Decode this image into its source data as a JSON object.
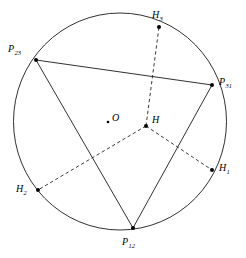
{
  "figure": {
    "background_color": "#ffffff",
    "stroke_color": "#1a1a1a",
    "point_color": "#000000",
    "width": 246,
    "height": 258
  },
  "chart_data": {
    "type": "diagram",
    "title": "",
    "xlabel": "",
    "ylabel": "",
    "circle": {
      "name": "circumcircle",
      "cx": 120,
      "cy": 121.5,
      "r": 106.5,
      "style": "solid"
    },
    "points": [
      {
        "id": "P23",
        "label": "P",
        "sub": "23",
        "x": 36,
        "y": 60,
        "label_x": 8,
        "label_y": 44,
        "on_circle": true,
        "marker": "dot"
      },
      {
        "id": "P31",
        "label": "P",
        "sub": "31",
        "x": 212,
        "y": 85,
        "label_x": 219,
        "label_y": 77,
        "on_circle": true,
        "marker": "dot"
      },
      {
        "id": "P12",
        "label": "P",
        "sub": "12",
        "x": 133,
        "y": 228,
        "label_x": 122,
        "label_y": 237,
        "on_circle": true,
        "marker": "dot"
      },
      {
        "id": "H3",
        "label": "H",
        "sub": "3",
        "x": 159,
        "y": 27,
        "label_x": 152,
        "label_y": 10,
        "on_circle": true,
        "marker": "dot"
      },
      {
        "id": "H1",
        "label": "H",
        "sub": "1",
        "x": 212,
        "y": 170,
        "label_x": 219,
        "label_y": 163,
        "on_circle": true,
        "marker": "dot"
      },
      {
        "id": "H2",
        "label": "H",
        "sub": "2",
        "x": 38,
        "y": 190,
        "label_x": 16,
        "label_y": 184,
        "on_circle": true,
        "marker": "dot"
      },
      {
        "id": "O",
        "label": "O",
        "sub": "",
        "x": 108,
        "y": 122,
        "label_x": 112,
        "label_y": 113,
        "on_circle": false,
        "marker": "small-dot"
      },
      {
        "id": "H",
        "label": "H",
        "sub": "",
        "x": 146,
        "y": 126,
        "label_x": 152,
        "label_y": 115,
        "on_circle": false,
        "marker": "dot"
      }
    ],
    "solid_segments": [
      {
        "name": "side-P23-P31",
        "from": "P23",
        "to": "P31",
        "x1": 36,
        "y1": 60,
        "x2": 212,
        "y2": 85
      },
      {
        "name": "side-P23-P12",
        "from": "P23",
        "to": "P12",
        "x1": 36,
        "y1": 60,
        "x2": 133,
        "y2": 228
      },
      {
        "name": "side-P31-P12",
        "from": "P31",
        "to": "P12",
        "x1": 212,
        "y1": 85,
        "x2": 133,
        "y2": 228
      }
    ],
    "dashed_segments": [
      {
        "name": "altitude-H-to-H3",
        "from": "H",
        "to": "H3",
        "x1": 146,
        "y1": 126,
        "x2": 159,
        "y2": 27
      },
      {
        "name": "altitude-H-to-H1",
        "from": "H",
        "to": "H1",
        "x1": 146,
        "y1": 126,
        "x2": 212,
        "y2": 170
      },
      {
        "name": "altitude-H-to-H2",
        "from": "H",
        "to": "H2",
        "x1": 146,
        "y1": 126,
        "x2": 38,
        "y2": 190
      }
    ],
    "legend": [],
    "annotations": []
  }
}
